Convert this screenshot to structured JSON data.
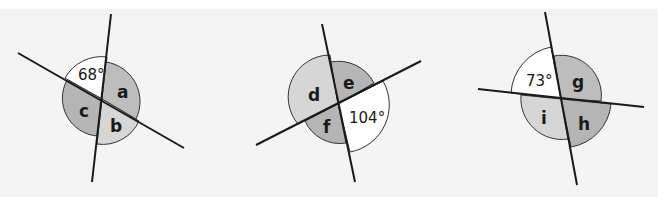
{
  "colors": {
    "background": "#f4f4f4",
    "line": "#1a1a1a",
    "white_sector": "#ffffff",
    "light_sector": "#d6d6d6",
    "dark_sector": "#b5b5b5"
  },
  "figures": [
    {
      "id": "figure-1",
      "given_angle": "68°",
      "unknowns": [
        "a",
        "b",
        "c"
      ]
    },
    {
      "id": "figure-2",
      "given_angle": "104°",
      "unknowns": [
        "d",
        "e",
        "f"
      ]
    },
    {
      "id": "figure-3",
      "given_angle": "73°",
      "unknowns": [
        "g",
        "h",
        "i"
      ]
    }
  ]
}
